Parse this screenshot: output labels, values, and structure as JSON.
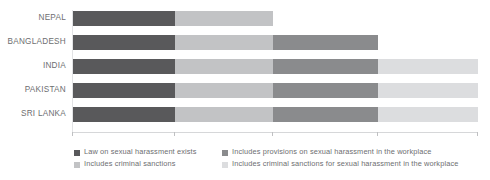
{
  "chart_data": {
    "type": "bar",
    "orientation": "horizontal",
    "stacked": true,
    "title": "",
    "subtitle": "",
    "xlabel": "",
    "ylabel": "",
    "grid": false,
    "legend_position": "bottom",
    "xlim": [
      0,
      4
    ],
    "xticks": [
      0,
      1,
      2,
      3,
      4
    ],
    "xticklabels": [
      "",
      "",
      "",
      "",
      ""
    ],
    "categories": [
      "NEPAL",
      "BANGLADESH",
      "INDIA",
      "PAKISTAN",
      "SRI LANKA"
    ],
    "series": [
      {
        "name": "Law on sexual harassment exists",
        "color": "#59595b",
        "values": [
          1,
          1,
          1,
          1,
          1
        ]
      },
      {
        "name": "Includes criminal sanctions",
        "color": "#c2c3c5",
        "values": [
          1,
          1,
          1,
          1,
          1
        ]
      },
      {
        "name": "Includes provisions on sexual harassment in the workplace",
        "color": "#8a8b8d",
        "values": [
          0,
          1,
          1,
          1,
          1
        ]
      },
      {
        "name": "Includes criminal sanctions for sexual harassment in the workplace",
        "color": "#dcdddf",
        "values": [
          0,
          0,
          1,
          1,
          1
        ]
      }
    ],
    "bar_totals": [
      2,
      3,
      4,
      4,
      4
    ]
  },
  "axis": {
    "line_color": "#d6d7d9",
    "tick_color": "#bfc0c2"
  },
  "rows": [
    {
      "label": "NEPAL",
      "segments": [
        {
          "series": 0,
          "width": 102,
          "color": "#59595b"
        },
        {
          "series": 1,
          "width": 98,
          "color": "#c2c3c5"
        }
      ]
    },
    {
      "label": "BANGLADESH",
      "segments": [
        {
          "series": 0,
          "width": 102,
          "color": "#59595b"
        },
        {
          "series": 1,
          "width": 98,
          "color": "#c2c3c5"
        },
        {
          "series": 2,
          "width": 105,
          "color": "#8a8b8d"
        }
      ]
    },
    {
      "label": "INDIA",
      "segments": [
        {
          "series": 0,
          "width": 102,
          "color": "#59595b"
        },
        {
          "series": 1,
          "width": 98,
          "color": "#c2c3c5"
        },
        {
          "series": 2,
          "width": 105,
          "color": "#8a8b8d"
        },
        {
          "series": 3,
          "width": 100,
          "color": "#dcdddf"
        }
      ]
    },
    {
      "label": "PAKISTAN",
      "segments": [
        {
          "series": 0,
          "width": 102,
          "color": "#59595b"
        },
        {
          "series": 1,
          "width": 98,
          "color": "#c2c3c5"
        },
        {
          "series": 2,
          "width": 105,
          "color": "#8a8b8d"
        },
        {
          "series": 3,
          "width": 100,
          "color": "#dcdddf"
        }
      ]
    },
    {
      "label": "SRI LANKA",
      "segments": [
        {
          "series": 0,
          "width": 102,
          "color": "#59595b"
        },
        {
          "series": 1,
          "width": 98,
          "color": "#c2c3c5"
        },
        {
          "series": 2,
          "width": 105,
          "color": "#8a8b8d"
        },
        {
          "series": 3,
          "width": 100,
          "color": "#dcdddf"
        }
      ]
    }
  ],
  "legend": {
    "items": [
      {
        "label": "Law on sexual harassment exists",
        "color": "#59595b"
      },
      {
        "label": "Includes criminal sanctions",
        "color": "#c2c3c5"
      },
      {
        "label": "Includes provisions on sexual harassment in the workplace",
        "color": "#8a8b8d"
      },
      {
        "label": "Includes criminal sanctions for sexual harassment in the workplace",
        "color": "#dcdddf"
      }
    ]
  },
  "ticks_px": [
    72,
    174,
    272,
    377,
    477
  ]
}
